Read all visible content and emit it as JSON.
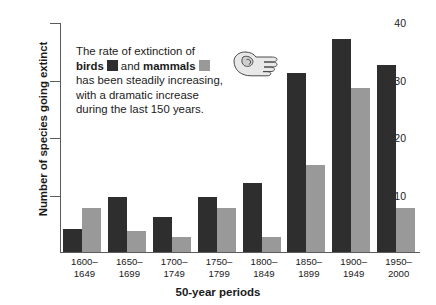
{
  "chart_data": {
    "type": "bar",
    "title": "",
    "xlabel": "50-year periods",
    "ylabel": "Number of species going extinct",
    "categories": [
      "1600–1649",
      "1650–1699",
      "1700–1749",
      "1750–1799",
      "1800–1849",
      "1850–1899",
      "1900–1949",
      "1950–2000"
    ],
    "category_lines": [
      [
        "1600–",
        "1649"
      ],
      [
        "1650–",
        "1699"
      ],
      [
        "1700–",
        "1749"
      ],
      [
        "1750–",
        "1799"
      ],
      [
        "1800–",
        "1849"
      ],
      [
        "1850–",
        "1899"
      ],
      [
        "1900–",
        "1949"
      ],
      [
        "1950–",
        "2000"
      ]
    ],
    "series": [
      {
        "name": "birds",
        "color": "#2e2e2e",
        "values": [
          4,
          9.5,
          6,
          9.5,
          12,
          31,
          37,
          32.5
        ]
      },
      {
        "name": "mammals",
        "color": "#999999",
        "values": [
          7.5,
          3.5,
          2.5,
          7.5,
          2.5,
          15,
          28.5,
          7.5
        ]
      }
    ],
    "ylim": [
      0,
      40
    ],
    "yticks": [
      10,
      20,
      30,
      40
    ],
    "ytick_labels": [
      "10",
      "20",
      "30",
      "40"
    ],
    "grid": false,
    "legend_position": "inline-annotation"
  },
  "annotation": {
    "line1": "The rate of extinction of",
    "line2_part1": "birds",
    "line2_part2": "and",
    "line2_part3": "mammals",
    "line3": "has been steadily increasing,",
    "line4": "with a dramatic increase",
    "line5": "during the last 150 years."
  },
  "icons": {
    "hand": "pointing-hand-icon"
  },
  "colors": {
    "birds": "#2e2e2e",
    "mammals": "#999999",
    "axis": "#5b5b5b",
    "text": "#1a1a1a",
    "background": "#ffffff"
  }
}
